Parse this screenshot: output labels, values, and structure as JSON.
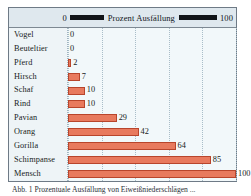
{
  "legend": {
    "min_label": "0",
    "title": "Prozent  Ausfällung",
    "max_label": "100"
  },
  "caption": "Abb. 1  Prozentuale Ausfällung von Eiweißniederschlägen ...",
  "colors": {
    "bar_fill": "#e87a5e",
    "bar_border": "#b8452c",
    "plot_background": "#f2f8fa",
    "band_background": "#dfe8ee",
    "frame_border": "#6e7a86",
    "gridline": "#a9bdc8",
    "text": "#181c22"
  },
  "chart_data": {
    "type": "bar",
    "orientation": "horizontal",
    "title": "Prozent  Ausfällung",
    "xlabel": "Prozent Ausfällung",
    "ylabel": "",
    "xlim": [
      0,
      100
    ],
    "xticks": [
      0,
      20,
      40,
      60,
      80,
      100
    ],
    "grid": true,
    "legend_position": "top",
    "categories": [
      "Vogel",
      "Beuteltier",
      "Pferd",
      "Hirsch",
      "Schaf",
      "Rind",
      "Pavian",
      "Orang",
      "Gorilla",
      "Schimpanse",
      "Mensch"
    ],
    "values": [
      0,
      0,
      2,
      7,
      10,
      10,
      29,
      42,
      64,
      85,
      100
    ],
    "value_labels": [
      "0",
      "0",
      "2",
      "7",
      "10",
      "10",
      "29",
      "42",
      "64",
      "85",
      "100"
    ]
  }
}
